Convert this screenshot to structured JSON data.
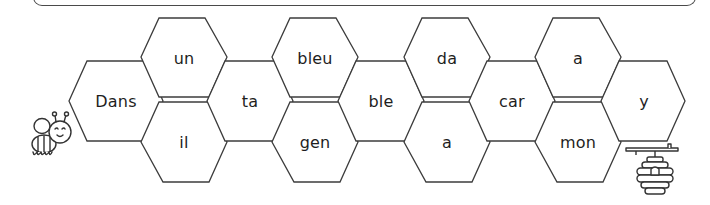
{
  "activity": {
    "type": "word-path honeycomb",
    "start_icon": "bee-icon",
    "end_icon": "beehive-icon"
  },
  "colors": {
    "stroke": "#3c3c3c",
    "text": "#1e1e1e",
    "background": "#ffffff"
  },
  "cells": [
    {
      "id": "c1",
      "word": "Dans",
      "row": "middle"
    },
    {
      "id": "c2",
      "word": "un",
      "row": "top"
    },
    {
      "id": "c3",
      "word": "il",
      "row": "bottom"
    },
    {
      "id": "c4",
      "word": "ta",
      "row": "middle"
    },
    {
      "id": "c5",
      "word": "bleu",
      "row": "top"
    },
    {
      "id": "c6",
      "word": "gen",
      "row": "bottom"
    },
    {
      "id": "c7",
      "word": "ble",
      "row": "middle"
    },
    {
      "id": "c8",
      "word": "da",
      "row": "top"
    },
    {
      "id": "c9",
      "word": "a",
      "row": "bottom"
    },
    {
      "id": "c10",
      "word": "car",
      "row": "middle"
    },
    {
      "id": "c11",
      "word": "a",
      "row": "top"
    },
    {
      "id": "c12",
      "word": "mon",
      "row": "bottom"
    },
    {
      "id": "c13",
      "word": "y",
      "row": "middle"
    }
  ]
}
